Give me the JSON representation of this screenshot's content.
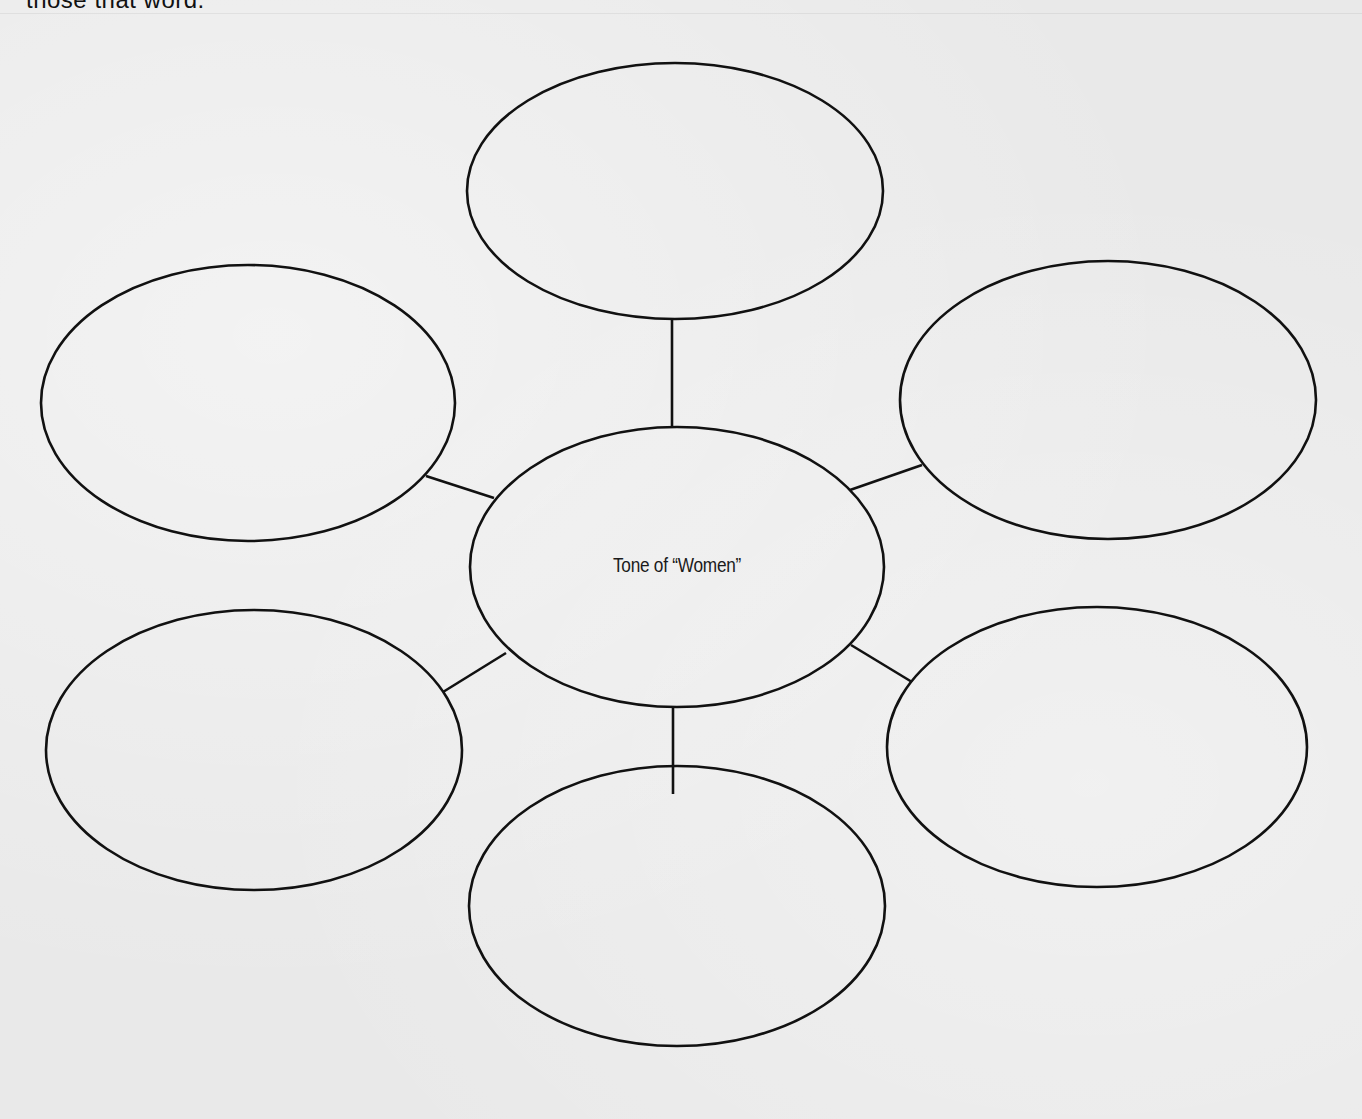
{
  "page": {
    "top_partial_text": "those that word."
  },
  "diagram": {
    "type": "web-organizer",
    "center": {
      "label": "Tone of “Women”",
      "cx": 677,
      "cy": 567,
      "rx": 207,
      "ry": 140
    },
    "bubbles": [
      {
        "id": "top",
        "label": "",
        "cx": 675,
        "cy": 191,
        "rx": 208,
        "ry": 128
      },
      {
        "id": "top-left",
        "label": "",
        "cx": 248,
        "cy": 403,
        "rx": 207,
        "ry": 138
      },
      {
        "id": "top-right",
        "label": "",
        "cx": 1108,
        "cy": 400,
        "rx": 208,
        "ry": 139
      },
      {
        "id": "bottom-left",
        "label": "",
        "cx": 254,
        "cy": 750,
        "rx": 208,
        "ry": 140
      },
      {
        "id": "bottom-right",
        "label": "",
        "cx": 1097,
        "cy": 747,
        "rx": 210,
        "ry": 140
      },
      {
        "id": "bottom",
        "label": "",
        "cx": 677,
        "cy": 906,
        "rx": 208,
        "ry": 140
      }
    ],
    "connectors": [
      {
        "from": "center",
        "to": "top",
        "x1": 672,
        "y1": 428,
        "x2": 672,
        "y2": 319
      },
      {
        "from": "center",
        "to": "top-left",
        "x1": 494,
        "y1": 498,
        "x2": 426,
        "y2": 476
      },
      {
        "from": "center",
        "to": "top-right",
        "x1": 850,
        "y1": 490,
        "x2": 922,
        "y2": 465
      },
      {
        "from": "center",
        "to": "bottom-left",
        "x1": 506,
        "y1": 653,
        "x2": 443,
        "y2": 692
      },
      {
        "from": "center",
        "to": "bottom-right",
        "x1": 851,
        "y1": 645,
        "x2": 912,
        "y2": 682
      },
      {
        "from": "center",
        "to": "bottom",
        "x1": 673,
        "y1": 707,
        "x2": 673,
        "y2": 794
      }
    ],
    "stroke_color": "#111111",
    "paper_color": "#e9e9e9"
  }
}
